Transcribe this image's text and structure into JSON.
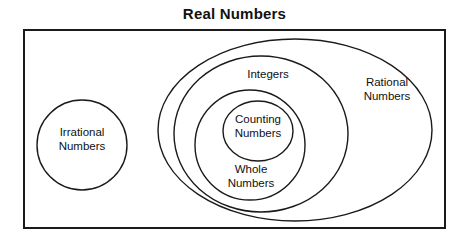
{
  "diagram": {
    "title": "Real Numbers",
    "type": "nested-set-venn-diagram",
    "canvas": {
      "width": 469,
      "height": 244,
      "background": "#ffffff"
    },
    "stroke_color": "#1a1a1a",
    "universe": {
      "name": "real-numbers-universe",
      "shape": "rectangle",
      "label": "Real Numbers",
      "label_position": "above-top-center",
      "x": 24,
      "y": 30,
      "width": 421,
      "height": 198,
      "stroke_width": 2
    },
    "sets": [
      {
        "id": "irrational-numbers",
        "label": "Irrational\nNumbers",
        "shape": "circle",
        "cx": 82,
        "cy": 145,
        "rx": 45,
        "ry": 45,
        "stroke_width": 1.4,
        "label_left": 37,
        "label_top": 125,
        "label_width": 90
      },
      {
        "id": "rational-numbers",
        "label": "Rational\nNumbers",
        "shape": "ellipse",
        "cx": 295,
        "cy": 130,
        "rx": 137,
        "ry": 91,
        "stroke_width": 1.4,
        "label_left": 345,
        "label_top": 75,
        "label_width": 84
      },
      {
        "id": "integers",
        "label": "Integers",
        "shape": "ellipse",
        "cx": 261,
        "cy": 134,
        "rx": 87,
        "ry": 78,
        "stroke_width": 1.4,
        "label_left": 228,
        "label_top": 67,
        "label_width": 80
      },
      {
        "id": "whole-numbers",
        "label": "Whole\nNumbers",
        "shape": "ellipse",
        "cx": 250,
        "cy": 145,
        "rx": 55,
        "ry": 55,
        "stroke_width": 1.4,
        "label_left": 208,
        "label_top": 162,
        "label_width": 86
      },
      {
        "id": "counting-numbers",
        "label": "Counting\nNumbers",
        "shape": "circle",
        "cx": 258,
        "cy": 131,
        "rx": 35,
        "ry": 30,
        "stroke_width": 1.4,
        "label_left": 215,
        "label_top": 112,
        "label_width": 86
      }
    ]
  }
}
